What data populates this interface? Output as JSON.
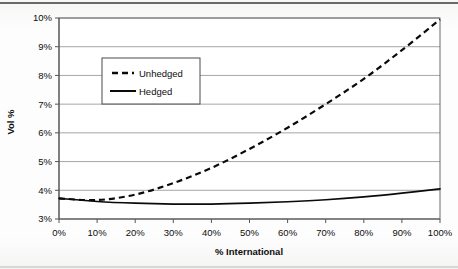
{
  "chart_data": {
    "type": "line",
    "title": "",
    "xlabel": "% International",
    "ylabel": "Vol %",
    "xlim": [
      0,
      100
    ],
    "ylim": [
      3,
      10
    ],
    "grid": true,
    "legend_position": "upper-left-inside",
    "x_tick_labels": [
      "0%",
      "10%",
      "20%",
      "30%",
      "40%",
      "50%",
      "60%",
      "70%",
      "80%",
      "90%",
      "100%"
    ],
    "y_tick_labels": [
      "3%",
      "4%",
      "5%",
      "6%",
      "7%",
      "8%",
      "9%",
      "10%"
    ],
    "x": [
      0,
      10,
      20,
      30,
      40,
      50,
      60,
      70,
      80,
      90,
      100
    ],
    "series": [
      {
        "name": "Unhedged",
        "style": "dashed",
        "color": "#0a0a0a",
        "values": [
          3.72,
          3.66,
          3.85,
          4.25,
          4.78,
          5.44,
          6.18,
          7.0,
          7.88,
          8.88,
          9.95
        ]
      },
      {
        "name": "Hedged",
        "style": "solid",
        "color": "#0a0a0a",
        "values": [
          3.72,
          3.61,
          3.55,
          3.52,
          3.52,
          3.55,
          3.6,
          3.67,
          3.77,
          3.9,
          4.05
        ]
      }
    ]
  },
  "legend": {
    "items": [
      {
        "label": "Unhedged",
        "style": "dashed"
      },
      {
        "label": "Hedged",
        "style": "solid"
      }
    ]
  },
  "axes": {
    "y_title": "Vol %",
    "x_title": "% International"
  }
}
